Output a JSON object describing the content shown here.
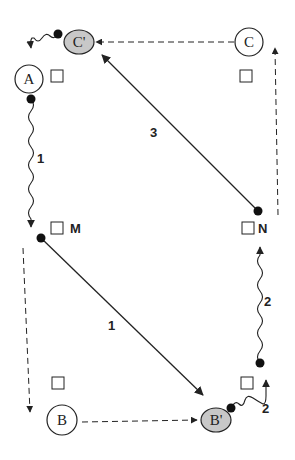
{
  "diagram": {
    "nodes": [
      {
        "id": "C_prime",
        "label": "C'",
        "shape": "ellipse",
        "fill": "#c8c8c8",
        "cx": 79,
        "cy": 42
      },
      {
        "id": "C",
        "label": "C",
        "shape": "circle",
        "fill": "#ffffff",
        "cx": 249,
        "cy": 42
      },
      {
        "id": "A",
        "label": "A",
        "shape": "circle",
        "fill": "#ffffff",
        "cx": 29,
        "cy": 79
      },
      {
        "id": "B",
        "label": "B",
        "shape": "circle",
        "fill": "#ffffff",
        "cx": 61,
        "cy": 420
      },
      {
        "id": "B_prime",
        "label": "B'",
        "shape": "ellipse",
        "fill": "#c8c8c8",
        "cx": 216,
        "cy": 420
      }
    ],
    "slots": [
      {
        "id": "slot-A",
        "label": ""
      },
      {
        "id": "slot-C",
        "label": ""
      },
      {
        "id": "slot-M",
        "label": "M"
      },
      {
        "id": "slot-N",
        "label": "N"
      },
      {
        "id": "slot-B",
        "label": ""
      },
      {
        "id": "slot-B-prime",
        "label": ""
      }
    ],
    "edges": [
      {
        "id": "edge-A-to-M-wavy",
        "style": "wavy",
        "label": "1"
      },
      {
        "id": "edge-M-to-Bprime",
        "style": "solid",
        "label": "1"
      },
      {
        "id": "edge-Bprime-to-N-wavy-short",
        "style": "wavy",
        "label": "2"
      },
      {
        "id": "edge-to-N-wavy-long",
        "style": "wavy",
        "label": "2"
      },
      {
        "id": "edge-N-to-Cprime",
        "style": "solid",
        "label": "3"
      },
      {
        "id": "edge-Cprime-to-A-wavy",
        "style": "wavy",
        "label": ""
      },
      {
        "id": "edge-C-to-Cprime-dashed",
        "style": "dashed",
        "label": ""
      },
      {
        "id": "edge-B-to-Bprime-dashed",
        "style": "dashed",
        "label": ""
      },
      {
        "id": "edge-left-dashed-down",
        "style": "dashed",
        "label": ""
      },
      {
        "id": "edge-right-dashed-up",
        "style": "dashed",
        "label": ""
      }
    ],
    "colors": {
      "stroke": "#222222",
      "shaded_node": "#c8c8c8",
      "background": "#ffffff"
    }
  }
}
